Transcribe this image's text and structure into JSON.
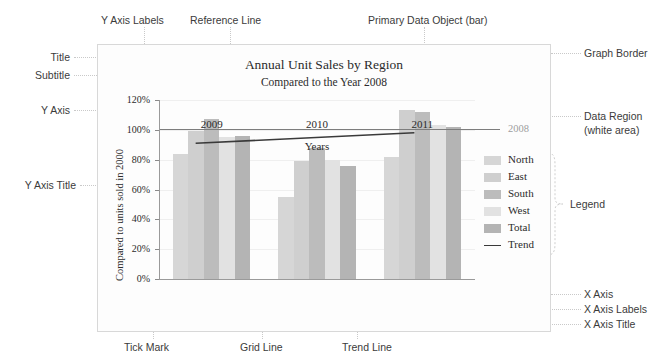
{
  "chart_data": {
    "type": "bar",
    "title": "Annual Unit Sales by Region",
    "subtitle": "Compared to the Year 2008",
    "xlabel": "Years",
    "ylabel": "Compared to units sold in 2000",
    "categories": [
      "2009",
      "2010",
      "2011"
    ],
    "ylim": [
      0,
      120
    ],
    "ytick_labels": [
      "0%",
      "20%",
      "40%",
      "60%",
      "80%",
      "100%",
      "120%"
    ],
    "ytick_values": [
      0,
      20,
      40,
      60,
      80,
      100,
      120
    ],
    "grid": true,
    "legend_position": "right",
    "series": [
      {
        "name": "North",
        "color": "#d6d6d6",
        "values": [
          84,
          55,
          82
        ]
      },
      {
        "name": "East",
        "color": "#cfcfcf",
        "values": [
          99,
          79,
          113
        ]
      },
      {
        "name": "South",
        "color": "#bcbcbc",
        "values": [
          107,
          88,
          112
        ]
      },
      {
        "name": "West",
        "color": "#e2e2e2",
        "values": [
          95,
          80,
          103
        ]
      },
      {
        "name": "Total",
        "color": "#b4b4b4",
        "values": [
          96,
          76,
          102
        ]
      }
    ],
    "reference_line": {
      "label": "2008",
      "value": 100,
      "color": "#7d7d7d"
    },
    "trend_line": {
      "name": "Trend",
      "color": "#3a3a3a",
      "start_value": 91,
      "end_value": 98
    }
  },
  "legend": {
    "entries": [
      {
        "label": "North"
      },
      {
        "label": "East"
      },
      {
        "label": "South"
      },
      {
        "label": "West"
      },
      {
        "label": "Total"
      },
      {
        "label": "Trend"
      }
    ]
  },
  "annotations": {
    "top": [
      {
        "label": "Y Axis Labels"
      },
      {
        "label": "Reference Line"
      },
      {
        "label": "Primary Data Object (bar)"
      }
    ],
    "left": [
      {
        "label": "Title"
      },
      {
        "label": "Subtitle"
      },
      {
        "label": "Y Axis"
      },
      {
        "label": "Y Axis Title"
      }
    ],
    "right": [
      {
        "label": "Graph Border"
      },
      {
        "label": "Data Region"
      },
      {
        "label": "(white area)"
      },
      {
        "label": "Legend"
      },
      {
        "label": "X Axis"
      },
      {
        "label": "X Axis Labels"
      },
      {
        "label": "X Axis Title"
      }
    ],
    "bottom": [
      {
        "label": "Tick Mark"
      },
      {
        "label": "Grid Line"
      },
      {
        "label": "Trend Line"
      }
    ]
  }
}
